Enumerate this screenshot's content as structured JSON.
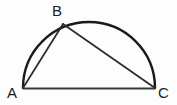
{
  "figure": {
    "background_color": "#fdfdfd",
    "width": 177,
    "height": 105,
    "stroke_color": "#1a1a1a"
  },
  "labels": {
    "a": "A",
    "b": "B",
    "c": "C"
  },
  "chart_data": {
    "type": "diagram",
    "shape": "semicircle-with-inscribed-right-triangle",
    "background": "#fdfdfd",
    "stroke": "#1a1a1a",
    "canvas": {
      "width": 177,
      "height": 105
    },
    "points": [
      {
        "name": "A",
        "label": "A",
        "x": 23,
        "y": 88,
        "label_x": 13,
        "label_y": 93,
        "on": "diameter-endpoint"
      },
      {
        "name": "B",
        "label": "B",
        "x": 63,
        "y": 24,
        "label_x": 58,
        "label_y": 11,
        "on": "arc"
      },
      {
        "name": "C",
        "label": "C",
        "x": 155,
        "y": 88,
        "label_x": 164,
        "label_y": 93,
        "on": "diameter-endpoint"
      }
    ],
    "circle": {
      "center_x": 89,
      "center_y": 88,
      "radius": 66,
      "arc_from_deg": 180,
      "arc_to_deg": 0,
      "apex_x": 89,
      "apex_y": 22
    },
    "segments": [
      {
        "name": "AB",
        "from": "A",
        "to": "B",
        "kind": "chord"
      },
      {
        "name": "BC",
        "from": "B",
        "to": "C",
        "kind": "chord"
      },
      {
        "name": "AC",
        "from": "A",
        "to": "C",
        "kind": "diameter"
      },
      {
        "name": "arc-ABC",
        "from": "A",
        "to": "C",
        "kind": "semicircular-arc"
      }
    ],
    "annotations": [],
    "legend": null,
    "grid": false
  }
}
